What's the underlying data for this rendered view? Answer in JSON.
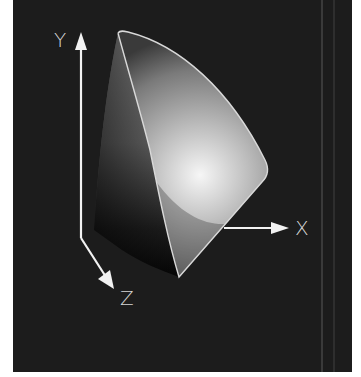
{
  "figure": {
    "background_color": "#1c1c1c",
    "axis_color": "#f2f2f2",
    "solid_highlight_color": "#f4f4f4",
    "solid_shadow_color": "#0a0a0a",
    "outline_color": "#d9d9d9"
  },
  "axes": {
    "y": {
      "label": "Y"
    },
    "x": {
      "label": "X"
    },
    "z": {
      "label": "Z"
    }
  }
}
